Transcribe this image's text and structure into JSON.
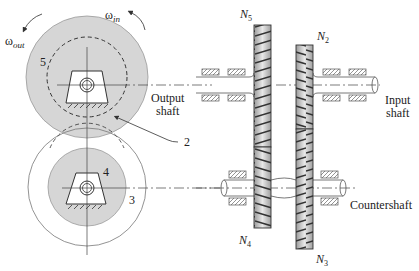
{
  "labels": {
    "omega_out": {
      "symbol": "ω",
      "sub": "out"
    },
    "omega_in": {
      "symbol": "ω",
      "sub": "in"
    },
    "gear5": "5",
    "gear2": "2",
    "gear4": "4",
    "gear3": "3",
    "output_shaft": [
      "Output",
      "shaft"
    ],
    "input_shaft": [
      "Input",
      "shaft"
    ],
    "countershaft": "Countershaft",
    "n5": {
      "symbol": "N",
      "sub": "5"
    },
    "n2": {
      "symbol": "N",
      "sub": "2"
    },
    "n4": {
      "symbol": "N",
      "sub": "4"
    },
    "n3": {
      "symbol": "N",
      "sub": "3"
    }
  },
  "colors": {
    "gear_fill": "#d9d9d9",
    "line": "#333333",
    "hatch": "#444444"
  }
}
